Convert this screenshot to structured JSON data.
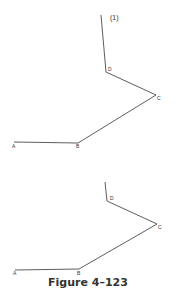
{
  "figures": [
    {
      "name": "figure-top",
      "annotation": "(1)",
      "points": {
        "top": [
          101,
          15
        ],
        "D": [
          106,
          72
        ],
        "C": [
          156,
          95
        ],
        "B": [
          78,
          143
        ],
        "A": [
          14,
          142
        ]
      },
      "labels": {
        "A": "A",
        "B": "B",
        "C": "C",
        "D": "D"
      }
    },
    {
      "name": "figure-bottom",
      "points": {
        "top": [
          105,
          182
        ],
        "D": [
          107,
          201
        ],
        "C": [
          157,
          224
        ],
        "B": [
          79,
          269
        ],
        "A": [
          15,
          270
        ]
      },
      "labels": {
        "A": "A",
        "B": "B",
        "C": "C",
        "D": "D"
      }
    }
  ],
  "caption": "Figure 4–123",
  "colors": {
    "line": "#333333",
    "background": "#ffffff"
  }
}
